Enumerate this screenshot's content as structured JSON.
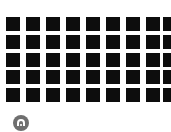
{
  "grid": {
    "rows": 5,
    "columns": 9,
    "cell_color": "#0d0d0d",
    "background_color": "#ffffff",
    "column_x": [
      6,
      26,
      46,
      66,
      86,
      106,
      126,
      146,
      163
    ],
    "row_y": [
      17,
      35,
      53,
      70,
      88
    ],
    "cell_size": 14
  },
  "badge": {
    "icon": "arch-icon",
    "color": "#6f6f6f",
    "glyph_color": "#ffffff"
  }
}
